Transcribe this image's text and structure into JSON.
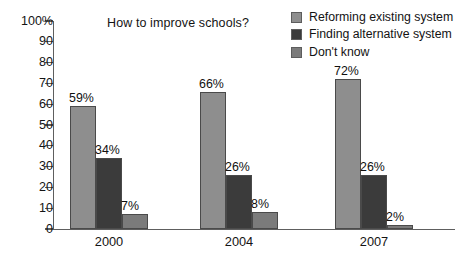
{
  "chart_data": {
    "type": "bar",
    "title": "How to improve schools?",
    "xlabel": "",
    "ylabel": "",
    "categories": [
      "2000",
      "2004",
      "2007"
    ],
    "ylim": [
      0,
      100
    ],
    "ytick_labels": [
      "100%",
      "90",
      "80",
      "70",
      "60",
      "50",
      "40",
      "30",
      "20",
      "10",
      "0"
    ],
    "ytick_values": [
      100,
      90,
      80,
      70,
      60,
      50,
      40,
      30,
      20,
      10,
      0
    ],
    "grid": false,
    "legend_position": "top-right",
    "value_suffix": "%",
    "series": [
      {
        "name": "Reforming existing system",
        "color": "#8e8e8e",
        "values": [
          59,
          66,
          72
        ],
        "labels": [
          "59%",
          "66%",
          "72%"
        ]
      },
      {
        "name": "Finding alternative system",
        "color": "#3b3b3b",
        "values": [
          34,
          26,
          26
        ],
        "labels": [
          "34%",
          "26%",
          "26%"
        ]
      },
      {
        "name": "Don't know",
        "color": "#7b7b7b",
        "values": [
          7,
          8,
          2
        ],
        "labels": [
          "7%",
          "8%",
          "2%"
        ]
      }
    ]
  },
  "legend": {
    "items": [
      {
        "label": "Reforming existing system",
        "color": "#8e8e8e"
      },
      {
        "label": "Finding alternative system",
        "color": "#3b3b3b"
      },
      {
        "label": "Don't know",
        "color": "#7b7b7b"
      }
    ]
  },
  "axis": {
    "axis_color": "#5e5e5e",
    "tick_color": "#5e5e5e"
  },
  "colors": {
    "background": "#ffffff",
    "text": "#141414",
    "series_1": "#8e8e8e",
    "series_2": "#3b3b3b",
    "series_3": "#7b7b7b"
  }
}
